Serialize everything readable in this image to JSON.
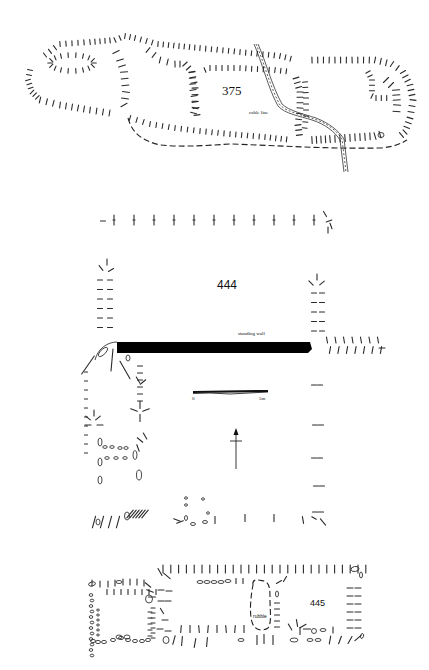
{
  "figure": {
    "structures": [
      {
        "id": "375",
        "label": "375"
      },
      {
        "id": "444",
        "label": "444"
      },
      {
        "id": "445",
        "label": "445"
      }
    ],
    "annotations": {
      "cable_line": "cable line",
      "standing_wall": "standing wall",
      "rubble": "rubble"
    },
    "scale_bar": {
      "start_label": "0",
      "end_label": "5m",
      "length_m": 5
    },
    "north_arrow": {
      "icon": "north-arrow-icon",
      "direction": "up"
    }
  }
}
